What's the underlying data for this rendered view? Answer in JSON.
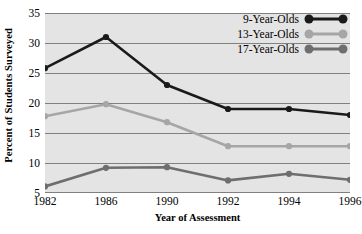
{
  "chart_data": {
    "type": "line",
    "title": "",
    "xlabel": "Year of Assessment",
    "ylabel": "Percent of Students Surveyed",
    "categories": [
      "1982",
      "1986",
      "1990",
      "1992",
      "1994",
      "1996"
    ],
    "x": [
      1982,
      1986,
      1990,
      1992,
      1994,
      1996
    ],
    "series": [
      {
        "name": "9-Year-Olds",
        "color": "#1a1a1a",
        "values": [
          25.8,
          31.0,
          23.0,
          19.0,
          19.0,
          18.0
        ]
      },
      {
        "name": "13-Year-Olds",
        "color": "#a6a6a6",
        "values": [
          17.8,
          19.8,
          16.8,
          12.8,
          12.8,
          12.8
        ]
      },
      {
        "name": "17-Year-Olds",
        "color": "#6e6e6e",
        "values": [
          6.1,
          9.2,
          9.3,
          7.1,
          8.2,
          7.2
        ]
      }
    ],
    "ylim": [
      5,
      35
    ],
    "yticks": [
      5,
      10,
      15,
      20,
      25,
      30,
      35
    ],
    "ytick_labels": [
      "5",
      "10",
      "15",
      "20",
      "25",
      "30",
      "35"
    ],
    "grid": true,
    "grid_color": "#808080",
    "plot_background": "#e4e4e4",
    "legend_position": "top-right",
    "legend_entries": [
      "9-Year-Olds",
      "13-Year-Olds",
      "17-Year-Olds"
    ]
  }
}
